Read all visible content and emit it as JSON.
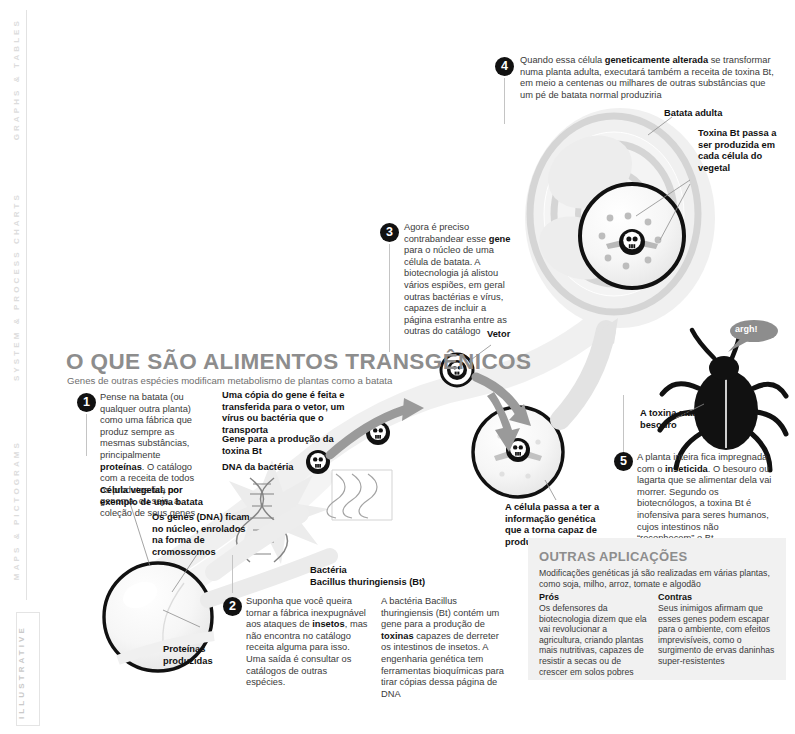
{
  "rail": {
    "labels": [
      "GRAPHS & TABLES",
      "SYSTEM & PROCESS CHARTS",
      "MAPS & PICTOGRAMS",
      "ILLUSTRATIVE"
    ]
  },
  "header": {
    "title": "O QUE SÃO ALIMENTOS TRANSGÊNICOS",
    "subtitle": "Genes de outras espécies modificam metabolismo de plantas como a batata"
  },
  "steps": [
    {
      "number": "1",
      "text_html": "Pense na batata (ou qualquer outra planta) como uma fábrica que produz sempre as mesmas substâncias, principalmente <b>proteínas</b>. O catálogo com a receita de todos os produtos fica no genoma, ou seja, a coleção de seus genes"
    },
    {
      "number": "2",
      "text_html": "Suponha que você queira tornar a fábrica inexpugnável aos ataques de <b>insetos</b>, mas não encontra no catálogo receita alguma para isso. Uma saída é consultar os catálogos de outras espécies."
    },
    {
      "number": "3",
      "text_html": "Agora é preciso contrabandear esse <b>gene</b> para o núcleo de uma célula de batata. A biotecnologia já alistou vários espiões, em geral outras bactérias e vírus, capazes de incluir a página estranha entre as outras do catálogo"
    },
    {
      "number": "4",
      "text_html": "Quando essa célula <b>geneticamente alterada</b> se transformar numa planta adulta, executará também a receita de toxina Bt, em meio a centenas ou milhares de outras substâncias que um pé de batata normal produziria"
    },
    {
      "number": "5",
      "text_html": "A planta inteira fica impregnada com o <b>inseticida</b>. O besouro ou lagarta que se alimentar dela vai morrer. Segundo os biotecnólogos, a toxina Bt é inofensiva para seres humanos, cujos intestinos não “reconhecem” o Bt"
    }
  ],
  "labels": {
    "plant_cell": "Célula vegetal, por exemplo de uma batata",
    "genes_dna": "Os genes (DNA) ficam no núcleo, enrolados na forma de cromossomos",
    "proteins": "Proteínas produzidas",
    "copy_gene": "Uma cópia do gene é feita e transferida para o vetor, um vírus ou bactéria que o transporta",
    "gene_bt": "Gene para a produção da toxina Bt",
    "dna_bacteria": "DNA da bactéria",
    "bacteria_name": "Bactéria\nBacillus thuringiensis (Bt)",
    "bacteria_name_l1": "Bactéria",
    "bacteria_name_l2": "Bacillus thuringiensis (Bt)",
    "bt_description": "A bactéria Bacillus thuringiensis (Bt) contém um gene para a produção de <b>toxinas</b> capazes de derreter os intestinos de insetos. A engenharia genética tem ferramentas bioquímicas para tirar cópias dessa página de DNA",
    "vector": "Vetor",
    "cell_gets_info": "A célula passa a ter a informação genética que a torna capaz de produzir a toxina",
    "adult_potato": "Batata adulta",
    "bt_toxin_each_cell": "Toxina Bt passa a ser produzida em cada célula do vegetal",
    "toxin_kills_beetle": "A toxina mata o besouro",
    "beetle_scream": "argh!"
  },
  "applications": {
    "title": "OUTRAS APLICAÇÕES",
    "description": "Modificações genéticas já são realizadas em várias plantas, como soja, milho, arroz, tomate e algodão",
    "pros_heading": "Prós",
    "pros_text": "Os defensores da biotecnologia dizem que ela vai revolucionar a agricultura, criando plantas mais nutritivas, capazes de resistir a secas ou de crescer em solos pobres",
    "cons_heading": "Contras",
    "cons_text": "Seus inimigos afirmam que esses genes podem escapar para o ambiente, com efeitos imprevisíveis, como o surgimento de ervas daninhas super-resistentes"
  },
  "colors": {
    "title_gray": "#8d8d8d",
    "rail_gray": "#dcdcdc",
    "panel_bg": "#f1f1f1",
    "arrow_gray": "#9a9a9a",
    "ink": "#111111"
  }
}
